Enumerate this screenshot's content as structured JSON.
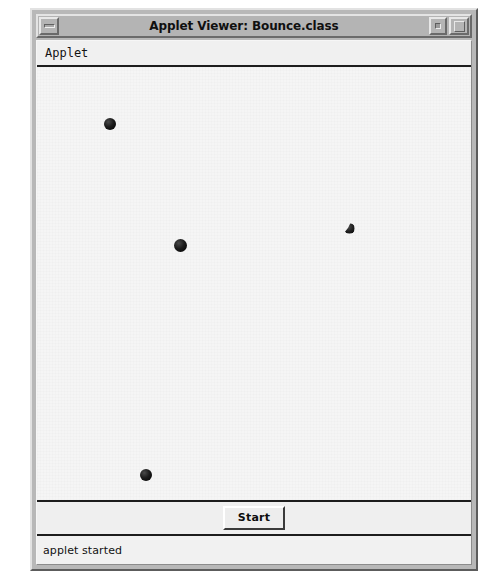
{
  "window": {
    "title": "Applet Viewer: Bounce.class",
    "controls": {
      "minimize_label": "minimize",
      "restore_label": "restore",
      "maximize_label": "maximize"
    }
  },
  "menubar": {
    "items": [
      {
        "label": "Applet"
      }
    ]
  },
  "applet": {
    "background_color": "#f5f5f5",
    "ball_color": "#000000",
    "balls": [
      {
        "id": "ball-1",
        "x": 109,
        "y": 126,
        "diameter": 12,
        "state": "full"
      },
      {
        "id": "ball-2",
        "x": 179,
        "y": 247,
        "diameter": 13,
        "state": "full"
      },
      {
        "id": "ball-3",
        "x": 348,
        "y": 230,
        "diameter": 11,
        "state": "partial"
      },
      {
        "id": "ball-4",
        "x": 145,
        "y": 477,
        "diameter": 12,
        "state": "full"
      }
    ]
  },
  "button_panel": {
    "start_label": "Start"
  },
  "statusbar": {
    "message": "applet started"
  }
}
